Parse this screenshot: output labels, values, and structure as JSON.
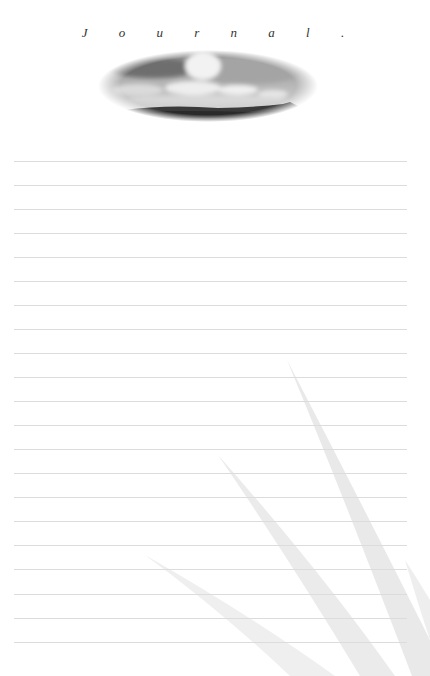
{
  "page": {
    "type": "journal-page",
    "title": "J o u r n a l .",
    "header_image": {
      "description": "grayscale oval photo of clouds over a dark mountain ridge",
      "shape": "ellipse"
    },
    "ruled_lines": {
      "count": 21,
      "first_y": 161,
      "spacing": 24.05,
      "color": "#dcdcdc"
    },
    "background_decoration": "faint gray grass/leaf blades in lower right",
    "colors": {
      "background": "#ffffff",
      "title": "#333333",
      "rule": "#dcdcdc",
      "leaf": "#ececec"
    }
  }
}
